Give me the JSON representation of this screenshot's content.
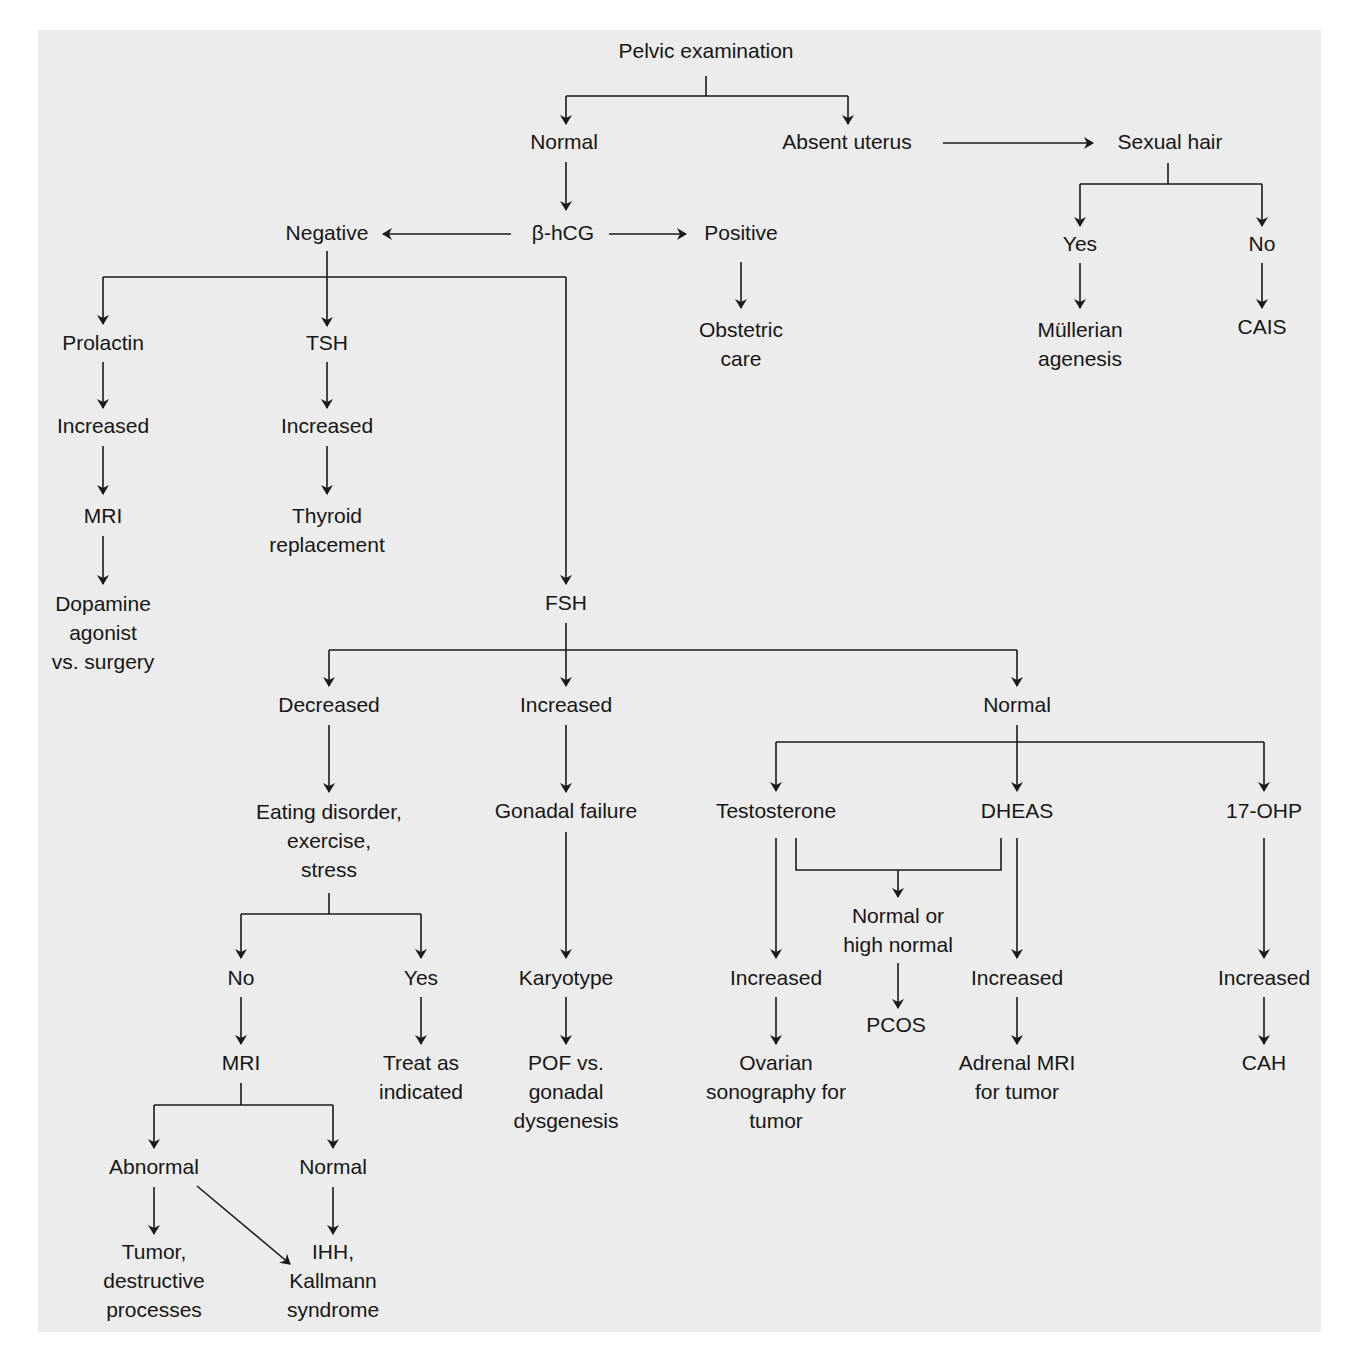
{
  "diagram": {
    "colors": {
      "background": "#ececec",
      "page": "#ffffff",
      "ink": "#161616"
    },
    "nodes": {
      "pelvic_exam": "Pelvic examination",
      "normal_exam": "Normal",
      "absent_uterus": "Absent uterus",
      "sexual_hair": "Sexual hair",
      "sexual_hair_yes": "Yes",
      "sexual_hair_no": "No",
      "mullerian_1": "Müllerian",
      "mullerian_2": "agenesis",
      "cais": "CAIS",
      "bhcg": "β-hCG",
      "negative": "Negative",
      "positive": "Positive",
      "obstetric_1": "Obstetric",
      "obstetric_2": "care",
      "prolactin": "Prolactin",
      "prolactin_increased": "Increased",
      "prolactin_mri": "MRI",
      "dopamine_1": "Dopamine",
      "dopamine_2": "agonist",
      "dopamine_3": "vs. surgery",
      "tsh": "TSH",
      "tsh_increased": "Increased",
      "thyroid_1": "Thyroid",
      "thyroid_2": "replacement",
      "fsh": "FSH",
      "fsh_decreased": "Decreased",
      "fsh_increased": "Increased",
      "fsh_normal": "Normal",
      "eating_1": "Eating disorder,",
      "eating_2": "exercise,",
      "eating_3": "stress",
      "eating_no": "No",
      "eating_yes": "Yes",
      "treat_1": "Treat as",
      "treat_2": "indicated",
      "no_mri": "MRI",
      "mri_abnormal": "Abnormal",
      "mri_normal": "Normal",
      "tumor_1": "Tumor,",
      "tumor_2": "destructive",
      "tumor_3": "processes",
      "ihh_1": "IHH,",
      "ihh_2": "Kallmann",
      "ihh_3": "syndrome",
      "gonadal_failure": "Gonadal failure",
      "karyotype": "Karyotype",
      "pof_1": "POF vs.",
      "pof_2": "gonadal",
      "pof_3": "dysgenesis",
      "testosterone": "Testosterone",
      "dheas": "DHEAS",
      "ohp": "17-OHP",
      "normal_high_1": "Normal or",
      "normal_high_2": "high normal",
      "pcos": "PCOS",
      "testo_increased": "Increased",
      "ovarian_1": "Ovarian",
      "ovarian_2": "sonography for",
      "ovarian_3": "tumor",
      "dheas_increased": "Increased",
      "adrenal_1": "Adrenal MRI",
      "adrenal_2": "for tumor",
      "ohp_increased": "Increased",
      "cah": "CAH"
    }
  }
}
